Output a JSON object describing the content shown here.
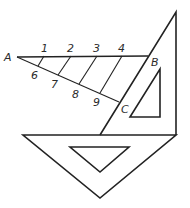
{
  "diagram": {
    "colors": {
      "stroke": "#222222",
      "label": "#2b2b2b",
      "background": "#ffffff"
    },
    "points": {
      "A": {
        "label": "A",
        "x": 17,
        "y": 57
      },
      "B": {
        "label": "B",
        "x": 148,
        "y": 56
      },
      "C": {
        "label": "C",
        "x": 119,
        "y": 102
      }
    },
    "top_labels": [
      {
        "label": "1",
        "x": 44,
        "y": 52
      },
      {
        "label": "2",
        "x": 71,
        "y": 52
      },
      {
        "label": "3",
        "x": 97,
        "y": 52
      },
      {
        "label": "4",
        "x": 122,
        "y": 52
      }
    ],
    "bottom_labels": [
      {
        "label": "6",
        "x": 32,
        "y": 79
      },
      {
        "label": "7",
        "x": 52,
        "y": 88
      },
      {
        "label": "8",
        "x": 73,
        "y": 98
      },
      {
        "label": "9",
        "x": 94,
        "y": 106
      }
    ],
    "point_labels": {
      "A": "A",
      "B": "B",
      "C": "C"
    },
    "shapes": {
      "upright_set_square": {
        "outer": [
          [
            176,
            12
          ],
          [
            176,
            135
          ],
          [
            100,
            135
          ]
        ],
        "inner": [
          [
            160,
            69
          ],
          [
            160,
            117
          ],
          [
            130,
            117
          ]
        ]
      },
      "base_set_square": {
        "outer": [
          [
            23,
            135
          ],
          [
            176,
            135
          ],
          [
            100,
            198
          ]
        ],
        "inner": [
          [
            70,
            147
          ],
          [
            129,
            147
          ],
          [
            100,
            172
          ]
        ]
      },
      "line_AB": [
        [
          17,
          57
        ],
        [
          148,
          56
        ]
      ],
      "line_AC": [
        [
          17,
          57
        ],
        [
          119,
          102
        ]
      ],
      "parallels": [
        [
          [
            44,
            56
          ],
          [
            38,
            66
          ]
        ],
        [
          [
            71,
            56
          ],
          [
            58,
            75
          ]
        ],
        [
          [
            97,
            56
          ],
          [
            79,
            84
          ]
        ],
        [
          [
            122,
            56
          ],
          [
            100,
            93
          ]
        ],
        [
          [
            148,
            56
          ],
          [
            119,
            102
          ]
        ]
      ]
    }
  }
}
